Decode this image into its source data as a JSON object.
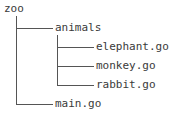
{
  "figure": {
    "type": "directory-tree",
    "background_color": "#ffffff",
    "text_color": "#3a3a3a",
    "line_color": "#555555"
  },
  "tree": {
    "root": {
      "label": "zoo",
      "kind": "directory"
    },
    "children": [
      {
        "label": "animals",
        "kind": "directory",
        "depth": 1,
        "is_last": false,
        "children": [
          {
            "label": "elephant.go",
            "kind": "file",
            "depth": 2,
            "is_last": false
          },
          {
            "label": "monkey.go",
            "kind": "file",
            "depth": 2,
            "is_last": false
          },
          {
            "label": "rabbit.go",
            "kind": "file",
            "depth": 2,
            "is_last": true
          }
        ]
      },
      {
        "label": "main.go",
        "kind": "file",
        "depth": 1,
        "is_last": true,
        "children": []
      }
    ]
  }
}
